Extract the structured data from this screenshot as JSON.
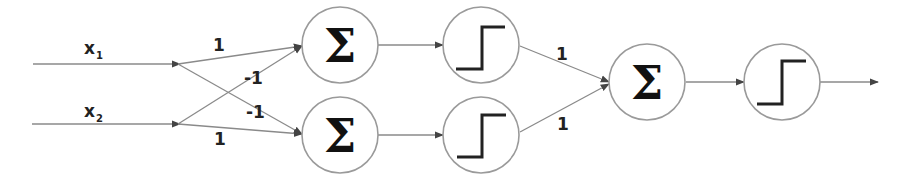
{
  "diagram": {
    "type": "neural-network",
    "colors": {
      "background": "#ffffff",
      "edge": "#808080",
      "node_border": "#999999",
      "glyph": "#222222"
    },
    "inputs": [
      {
        "id": "x1",
        "label": "x",
        "subscript": "1"
      },
      {
        "id": "x2",
        "label": "x",
        "subscript": "2"
      }
    ],
    "hidden_sum_nodes": [
      {
        "id": "s1",
        "symbol": "Σ"
      },
      {
        "id": "s2",
        "symbol": "Σ"
      }
    ],
    "hidden_step_nodes": [
      {
        "id": "h1",
        "icon": "step-function-icon"
      },
      {
        "id": "h2",
        "icon": "step-function-icon"
      }
    ],
    "output_sum_node": {
      "id": "s3",
      "symbol": "Σ"
    },
    "output_step_node": {
      "id": "o",
      "icon": "step-function-icon"
    },
    "weights": {
      "x1_s1": "1",
      "x2_s1": "-1",
      "x1_s2": "-1",
      "x2_s2": "1",
      "h1_s3": "1",
      "h2_s3": "1"
    },
    "edges": [
      {
        "from": "x1",
        "to": "s1",
        "weight": "1"
      },
      {
        "from": "x1",
        "to": "s2",
        "weight": "-1"
      },
      {
        "from": "x2",
        "to": "s1",
        "weight": "-1"
      },
      {
        "from": "x2",
        "to": "s2",
        "weight": "1"
      },
      {
        "from": "s1",
        "to": "h1"
      },
      {
        "from": "s2",
        "to": "h2"
      },
      {
        "from": "h1",
        "to": "s3",
        "weight": "1"
      },
      {
        "from": "h2",
        "to": "s3",
        "weight": "1"
      },
      {
        "from": "s3",
        "to": "o"
      },
      {
        "from": "o",
        "to": "output"
      }
    ]
  }
}
